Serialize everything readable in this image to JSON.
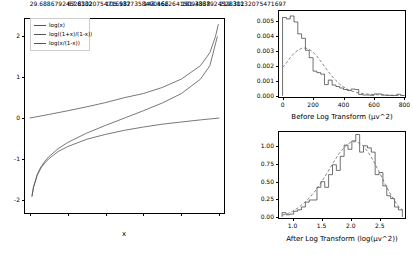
{
  "figure": {
    "background": "#ffffff",
    "line_color": "#555555",
    "axis_color": "#000000",
    "dashed_color": "#666666"
  },
  "chart_data": [
    {
      "type": "line",
      "panel": "left",
      "title": "",
      "xlabel": "x",
      "ylabel": "",
      "xlim": [
        -0.03,
        1.03
      ],
      "ylim": [
        -2.35,
        2.45
      ],
      "xticks": [
        "0.0",
        "0.2",
        "0.4",
        "0.6",
        "0.8",
        "1.0"
      ],
      "xtick_values": [
        0.0,
        0.2,
        0.4,
        0.6,
        0.8,
        1.0
      ],
      "yticks": [
        "2",
        "1",
        "0",
        "-1",
        "-2"
      ],
      "ytick_values": [
        2,
        1,
        0,
        -1,
        -2
      ],
      "grid": false,
      "legend_position": "upper left",
      "series": [
        {
          "name": "log(x)",
          "x": [
            0.012,
            0.02,
            0.04,
            0.06,
            0.08,
            0.1,
            0.15,
            0.2,
            0.3,
            0.4,
            0.5,
            0.6,
            0.7,
            0.8,
            0.9,
            0.95,
            1.0
          ],
          "values": [
            -1.92,
            -1.7,
            -1.4,
            -1.22,
            -1.1,
            -1.0,
            -0.82,
            -0.7,
            -0.52,
            -0.4,
            -0.3,
            -0.22,
            -0.15,
            -0.097,
            -0.046,
            -0.022,
            0.0
          ]
        },
        {
          "name": "log((1+x)/(1-x))",
          "x": [
            0.0,
            0.05,
            0.1,
            0.2,
            0.3,
            0.4,
            0.5,
            0.6,
            0.7,
            0.8,
            0.9,
            0.95,
            0.98,
            0.995
          ],
          "values": [
            0.0,
            0.043,
            0.087,
            0.177,
            0.274,
            0.379,
            0.5,
            0.6,
            0.75,
            0.955,
            1.28,
            1.6,
            2.0,
            2.3
          ]
        },
        {
          "name": "log(x/(1-x))",
          "x": [
            0.012,
            0.02,
            0.04,
            0.06,
            0.08,
            0.1,
            0.15,
            0.2,
            0.3,
            0.4,
            0.5,
            0.6,
            0.7,
            0.8,
            0.9,
            0.95,
            0.99
          ],
          "values": [
            -1.92,
            -1.69,
            -1.38,
            -1.19,
            -1.06,
            -0.95,
            -0.75,
            -0.6,
            -0.37,
            -0.18,
            0.0,
            0.18,
            0.37,
            0.6,
            0.95,
            1.28,
            2.0
          ]
        }
      ],
      "legend": [
        "log(x)",
        "log((1+x)/(1-x))",
        "log(x/(1-x))"
      ]
    },
    {
      "type": "bar",
      "panel": "top-right",
      "title": "",
      "xlabel": "Before Log Transform (μv^2)",
      "ylabel": "",
      "xlim": [
        -30,
        810
      ],
      "ylim": [
        -0.00015,
        0.00575
      ],
      "xticks": [
        "0",
        "200",
        "400",
        "600",
        "800"
      ],
      "xtick_values": [
        0,
        200,
        400,
        600,
        800
      ],
      "yticks": [
        "0.000",
        "0.001",
        "0.002",
        "0.003",
        "0.004",
        "0.005"
      ],
      "ytick_values": [
        0.0,
        0.001,
        0.002,
        0.003,
        0.004,
        0.005
      ],
      "grid": false,
      "bin_width": 25,
      "bin_starts": [
        0,
        25,
        50,
        75,
        100,
        125,
        150,
        175,
        200,
        225,
        250,
        275,
        300,
        325,
        350,
        375,
        400,
        425,
        450,
        475,
        500,
        525,
        550,
        575,
        600,
        625,
        650,
        675,
        700,
        725,
        750,
        775
      ],
      "values": [
        0.00525,
        0.00515,
        0.00535,
        0.00495,
        0.00415,
        0.00385,
        0.00305,
        0.00255,
        0.00165,
        0.00155,
        0.00145,
        0.00075,
        0.00105,
        0.00072,
        0.00062,
        0.00052,
        0.00042,
        0.00035,
        0.00045,
        0.00042,
        8e-05,
        5e-05,
        5e-05,
        3e-05,
        0.00012,
        0.00012,
        5e-05,
        3e-05,
        2e-05,
        2e-05,
        0.0001,
        2e-05
      ],
      "overlay": {
        "name": "kde-curve",
        "style": "dashed",
        "x": [
          0,
          25,
          50,
          75,
          100,
          125,
          150,
          175,
          200,
          225,
          250,
          275,
          300,
          325,
          350,
          375,
          400,
          425,
          450,
          475,
          500,
          550,
          600,
          650,
          700,
          750,
          800
        ],
        "y": [
          0.0019,
          0.0022,
          0.00255,
          0.00285,
          0.00305,
          0.00318,
          0.0032,
          0.00312,
          0.00292,
          0.00265,
          0.00232,
          0.00197,
          0.00162,
          0.0013,
          0.00102,
          0.00078,
          0.00059,
          0.00044,
          0.00033,
          0.00025,
          0.00019,
          0.00012,
          8e-05,
          6e-05,
          4e-05,
          3e-05,
          2e-05
        ]
      }
    },
    {
      "type": "bar",
      "panel": "bottom-right",
      "title": "",
      "xlabel": "After Log Transform (log(μv^2))",
      "ylabel": "",
      "xlim": [
        0.75,
        2.95
      ],
      "ylim": [
        -0.03,
        1.22
      ],
      "xticks": [
        "1.0",
        "1.5",
        "2.0",
        "2.5"
      ],
      "xtick_values": [
        1.0,
        1.5,
        2.0,
        2.5
      ],
      "yticks": [
        "0.00",
        "0.25",
        "0.50",
        "0.75",
        "1.00"
      ],
      "ytick_values": [
        0.0,
        0.25,
        0.5,
        0.75,
        1.0
      ],
      "grid": false,
      "bin_width": 0.0667,
      "bin_starts": [
        0.82,
        0.887,
        0.953,
        1.02,
        1.087,
        1.153,
        1.22,
        1.287,
        1.353,
        1.42,
        1.487,
        1.553,
        1.62,
        1.687,
        1.753,
        1.82,
        1.887,
        1.953,
        2.02,
        2.087,
        2.153,
        2.22,
        2.287,
        2.353,
        2.42,
        2.487,
        2.553,
        2.62,
        2.687,
        2.753,
        2.82
      ],
      "values": [
        0.06,
        0.03,
        0.04,
        0.08,
        0.1,
        0.14,
        0.21,
        0.24,
        0.24,
        0.42,
        0.5,
        0.42,
        0.6,
        0.74,
        0.66,
        0.86,
        1.02,
        0.96,
        1.08,
        1.17,
        0.92,
        1.01,
        0.98,
        0.92,
        0.6,
        0.63,
        0.44,
        0.3,
        0.26,
        0.14,
        0.1
      ],
      "overlay": {
        "name": "kde-curve",
        "style": "dashed",
        "x": [
          0.82,
          0.9,
          1.0,
          1.1,
          1.2,
          1.3,
          1.4,
          1.5,
          1.6,
          1.7,
          1.8,
          1.9,
          2.0,
          2.1,
          2.2,
          2.3,
          2.4,
          2.5,
          2.6,
          2.7,
          2.8,
          2.9
        ],
        "y": [
          0.025,
          0.04,
          0.08,
          0.13,
          0.2,
          0.28,
          0.38,
          0.5,
          0.63,
          0.77,
          0.9,
          1.0,
          1.06,
          1.07,
          1.02,
          0.92,
          0.78,
          0.62,
          0.45,
          0.3,
          0.17,
          0.09
        ]
      }
    }
  ]
}
